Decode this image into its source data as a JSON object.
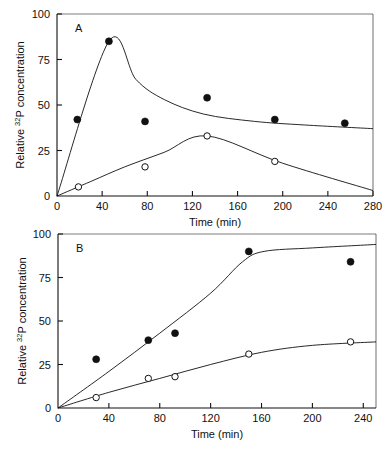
{
  "figure": {
    "name": "two-panel-time-course",
    "panels": [
      "A",
      "B"
    ]
  },
  "panel_a": {
    "letter": "A",
    "xlabel": "Time  (min)",
    "ylabel_main": "Relative",
    "ylabel_sup": "32",
    "ylabel_tail": "P concentration",
    "xticks": [
      "0",
      "40",
      "80",
      "120",
      "160",
      "200",
      "240",
      "280"
    ],
    "yticks": [
      "0",
      "25",
      "50",
      "75",
      "100"
    ]
  },
  "panel_b": {
    "letter": "B",
    "xlabel": "Time (min)",
    "ylabel_main": "Relative",
    "ylabel_sup": "32",
    "ylabel_tail": "P concentration",
    "xticks": [
      "0",
      "40",
      "80",
      "120",
      "160",
      "200",
      "240"
    ],
    "yticks": [
      "0",
      "25",
      "50",
      "75",
      "100"
    ]
  },
  "chart_data": [
    {
      "type": "scatter",
      "title": "A",
      "xlabel": "Time (min)",
      "ylabel": "Relative 32P concentration",
      "xlim": [
        0,
        280
      ],
      "ylim": [
        0,
        100
      ],
      "xticks": [
        0,
        40,
        80,
        120,
        160,
        200,
        240,
        280
      ],
      "yticks": [
        0,
        25,
        50,
        75,
        100
      ],
      "grid": false,
      "legend": "none",
      "series": [
        {
          "name": "filled-circles",
          "marker": "filled circle",
          "points": [
            {
              "x": 18,
              "y": 42
            },
            {
              "x": 46,
              "y": 85
            },
            {
              "x": 78,
              "y": 41
            },
            {
              "x": 133,
              "y": 54
            },
            {
              "x": 193,
              "y": 42
            },
            {
              "x": 255,
              "y": 40
            }
          ],
          "fit_curve": [
            {
              "x": 0,
              "y": 0
            },
            {
              "x": 46,
              "y": 85
            },
            {
              "x": 70,
              "y": 64
            },
            {
              "x": 95,
              "y": 53
            },
            {
              "x": 130,
              "y": 45
            },
            {
              "x": 175,
              "y": 41
            },
            {
              "x": 220,
              "y": 39
            },
            {
              "x": 280,
              "y": 37
            }
          ]
        },
        {
          "name": "open-circles",
          "marker": "open circle",
          "points": [
            {
              "x": 19,
              "y": 5
            },
            {
              "x": 78,
              "y": 16
            },
            {
              "x": 133,
              "y": 33
            },
            {
              "x": 193,
              "y": 19
            }
          ],
          "fit_curve": [
            {
              "x": 0,
              "y": 0
            },
            {
              "x": 30,
              "y": 8
            },
            {
              "x": 60,
              "y": 16
            },
            {
              "x": 95,
              "y": 24
            },
            {
              "x": 133,
              "y": 33
            },
            {
              "x": 200,
              "y": 18
            },
            {
              "x": 280,
              "y": 3
            }
          ]
        }
      ]
    },
    {
      "type": "scatter",
      "title": "B",
      "xlabel": "Time (min)",
      "ylabel": "Relative 32P concentration",
      "xlim": [
        0,
        250
      ],
      "ylim": [
        0,
        100
      ],
      "xticks": [
        0,
        40,
        80,
        120,
        160,
        200,
        240
      ],
      "yticks": [
        0,
        25,
        50,
        75,
        100
      ],
      "grid": false,
      "legend": "none",
      "series": [
        {
          "name": "filled-circles",
          "marker": "filled circle",
          "points": [
            {
              "x": 30,
              "y": 28
            },
            {
              "x": 71,
              "y": 39
            },
            {
              "x": 92,
              "y": 43
            },
            {
              "x": 150,
              "y": 90
            },
            {
              "x": 230,
              "y": 84
            }
          ],
          "fit_curve": [
            {
              "x": 0,
              "y": 0
            },
            {
              "x": 40,
              "y": 21
            },
            {
              "x": 80,
              "y": 43
            },
            {
              "x": 120,
              "y": 66
            },
            {
              "x": 145,
              "y": 84
            },
            {
              "x": 162,
              "y": 90
            },
            {
              "x": 200,
              "y": 92
            },
            {
              "x": 250,
              "y": 94
            }
          ]
        },
        {
          "name": "open-circles",
          "marker": "open circle",
          "points": [
            {
              "x": 30,
              "y": 6
            },
            {
              "x": 71,
              "y": 17
            },
            {
              "x": 92,
              "y": 18
            },
            {
              "x": 150,
              "y": 31
            },
            {
              "x": 230,
              "y": 38
            }
          ],
          "fit_curve": [
            {
              "x": 0,
              "y": 0
            },
            {
              "x": 40,
              "y": 9
            },
            {
              "x": 80,
              "y": 17
            },
            {
              "x": 120,
              "y": 25
            },
            {
              "x": 160,
              "y": 32
            },
            {
              "x": 200,
              "y": 36
            },
            {
              "x": 250,
              "y": 38
            }
          ]
        }
      ]
    }
  ]
}
